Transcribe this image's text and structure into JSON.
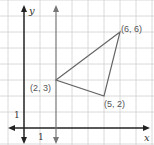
{
  "diagram": {
    "axes": {
      "x_label": "x",
      "y_label": "y",
      "x_tick": "1",
      "y_tick": "1"
    },
    "points": [
      {
        "label": "(2, 3)",
        "x": 2,
        "y": 3
      },
      {
        "label": "(6, 6)",
        "x": 6,
        "y": 6
      },
      {
        "label": "(5, 2)",
        "x": 5,
        "y": 2
      }
    ],
    "vertical_line": {
      "x": 2
    },
    "colors": {
      "grid": "#cccccc",
      "axis": "#222222",
      "triangle": "#666666",
      "line": "#777777",
      "text": "#555555"
    }
  }
}
